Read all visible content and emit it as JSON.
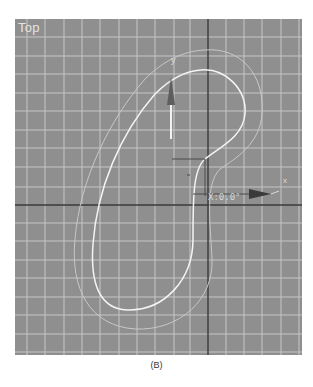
{
  "viewport": {
    "label": "Top",
    "background": "#8f8f8f",
    "grid_color": "#c6c6c6",
    "axis_color": "#3a3a3a",
    "grid_spacing_px": 18.3
  },
  "gizmo": {
    "x_label": "x",
    "y_label": "y",
    "readout": "X:0.0°"
  },
  "shapes": {
    "inner_spline": {
      "color": "#f4f4f4",
      "selected": true
    },
    "outer_spline": {
      "color": "#c8c8c8",
      "selected": false
    }
  },
  "caption": "(B)"
}
